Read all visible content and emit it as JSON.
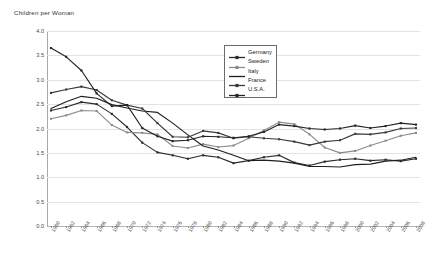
{
  "chart_data": {
    "type": "line",
    "title": "Children per Woman",
    "xlabel": "",
    "ylabel": "",
    "ylim": [
      0.0,
      4.0
    ],
    "ytick_step": 0.5,
    "grid": true,
    "legend_position": "upper-center-right",
    "x": [
      1960,
      1962,
      1964,
      1966,
      1968,
      1970,
      1972,
      1974,
      1976,
      1978,
      1980,
      1982,
      1984,
      1986,
      1988,
      1990,
      1992,
      1994,
      1996,
      1998,
      2000,
      2002,
      2004,
      2006,
      2008
    ],
    "ytick_labels": [
      "0.0",
      "0.5",
      "1.0",
      "1.5",
      "2.0",
      "2.5",
      "3.0",
      "3.5",
      "4.0"
    ],
    "xtick_labels": [
      "1960",
      "1962",
      "1964",
      "1966",
      "1968",
      "1970",
      "1972",
      "1974",
      "1976",
      "1978",
      "1980",
      "1982",
      "1984",
      "1986",
      "1988",
      "1990",
      "1992",
      "1994",
      "1996",
      "1998",
      "2000",
      "2002",
      "2004",
      "2006",
      "2008"
    ],
    "series": [
      {
        "name": "Germany",
        "color": "#2b2b2b",
        "marker": "square",
        "values": [
          2.37,
          2.44,
          2.54,
          2.5,
          2.3,
          2.03,
          1.71,
          1.51,
          1.45,
          1.38,
          1.45,
          1.41,
          1.29,
          1.34,
          1.41,
          1.45,
          1.3,
          1.24,
          1.32,
          1.36,
          1.38,
          1.34,
          1.36,
          1.33,
          1.38
        ]
      },
      {
        "name": "Sweden",
        "color": "#8c8c8c",
        "marker": "square",
        "values": [
          2.2,
          2.27,
          2.37,
          2.36,
          2.07,
          1.92,
          1.91,
          1.88,
          1.64,
          1.6,
          1.68,
          1.62,
          1.65,
          1.8,
          1.96,
          2.13,
          2.09,
          1.88,
          1.61,
          1.5,
          1.54,
          1.65,
          1.75,
          1.85,
          1.91
        ]
      },
      {
        "name": "Italy",
        "color": "#1f1f1f",
        "marker": "none",
        "values": [
          2.41,
          2.55,
          2.66,
          2.62,
          2.49,
          2.42,
          2.36,
          2.33,
          2.11,
          1.87,
          1.64,
          1.56,
          1.45,
          1.34,
          1.35,
          1.33,
          1.29,
          1.22,
          1.22,
          1.21,
          1.26,
          1.27,
          1.33,
          1.35,
          1.41
        ]
      },
      {
        "name": "France",
        "color": "#3a3a3a",
        "marker": "square",
        "values": [
          2.73,
          2.8,
          2.86,
          2.79,
          2.58,
          2.48,
          2.41,
          2.11,
          1.83,
          1.82,
          1.95,
          1.91,
          1.8,
          1.83,
          1.8,
          1.78,
          1.73,
          1.66,
          1.73,
          1.76,
          1.89,
          1.88,
          1.92,
          2.0,
          2.01
        ]
      },
      {
        "name": "U.S.A.",
        "color": "#252525",
        "marker": "square",
        "values": [
          3.65,
          3.47,
          3.19,
          2.72,
          2.46,
          2.48,
          2.01,
          1.84,
          1.74,
          1.76,
          1.84,
          1.83,
          1.81,
          1.84,
          1.93,
          2.08,
          2.05,
          2.0,
          1.98,
          2.0,
          2.06,
          2.01,
          2.05,
          2.11,
          2.08
        ]
      }
    ]
  }
}
